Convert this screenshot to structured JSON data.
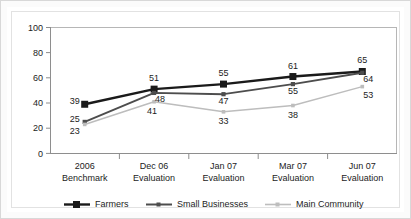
{
  "chart_data": {
    "type": "line",
    "title": "",
    "subtitle": "",
    "xlabel": "",
    "ylabel": "",
    "ylim": [
      0,
      100
    ],
    "yticks": [
      "0",
      "20",
      "40",
      "60",
      "80",
      "100"
    ],
    "grid": false,
    "legend_position": "bottom",
    "categories": [
      "2006\nBenchmark",
      "Dec 06\nEvaluation",
      "Jan 07\nEvaluation",
      "Mar 07\nEvaluation",
      "Jun 07\nEvaluation"
    ],
    "category_lines": [
      [
        "2006",
        "Benchmark"
      ],
      [
        "Dec 06",
        "Evaluation"
      ],
      [
        "Jan 07",
        "Evaluation"
      ],
      [
        "Mar 07",
        "Evaluation"
      ],
      [
        "Jun 07",
        "Evaluation"
      ]
    ],
    "series": [
      {
        "name": "Farmers",
        "color": "#1a1a1a",
        "marker": "square",
        "values": [
          39,
          51,
          55,
          61,
          65
        ]
      },
      {
        "name": "Small Businesses",
        "color": "#4d4d4d",
        "marker": "small-square",
        "values": [
          25,
          48,
          47,
          55,
          64
        ]
      },
      {
        "name": "Main Community",
        "color": "#bdbdbd",
        "marker": "small-square",
        "values": [
          23,
          41,
          33,
          38,
          53
        ]
      }
    ]
  },
  "axis": {
    "y_tick_0": "0",
    "y_tick_1": "20",
    "y_tick_2": "40",
    "y_tick_3": "60",
    "y_tick_4": "80",
    "y_tick_5": "100"
  },
  "category_labels": {
    "c0_line1": "2006",
    "c0_line2": "Benchmark",
    "c1_line1": "Dec 06",
    "c1_line2": "Evaluation",
    "c2_line1": "Jan 07",
    "c2_line2": "Evaluation",
    "c3_line1": "Mar 07",
    "c3_line2": "Evaluation",
    "c4_line1": "Jun 07",
    "c4_line2": "Evaluation"
  },
  "legend": {
    "items": [
      {
        "label": "Farmers",
        "color": "#1a1a1a"
      },
      {
        "label": "Small Businesses",
        "color": "#4d4d4d"
      },
      {
        "label": "Main Community",
        "color": "#bdbdbd"
      }
    ]
  },
  "point_labels": {
    "farmers": [
      "39",
      "51",
      "55",
      "61",
      "65"
    ],
    "small_businesses": [
      "25",
      "48",
      "47",
      "55",
      "64"
    ],
    "main_community": [
      "23",
      "41",
      "33",
      "38",
      "53"
    ]
  },
  "colors": {
    "farmers": "#1a1a1a",
    "small_businesses": "#4d4d4d",
    "main_community": "#bdbdbd",
    "axis": "#9a9a9a",
    "text": "#1c1c1c",
    "page_background": "#fbfbfb",
    "plot_background": "#ffffff"
  }
}
